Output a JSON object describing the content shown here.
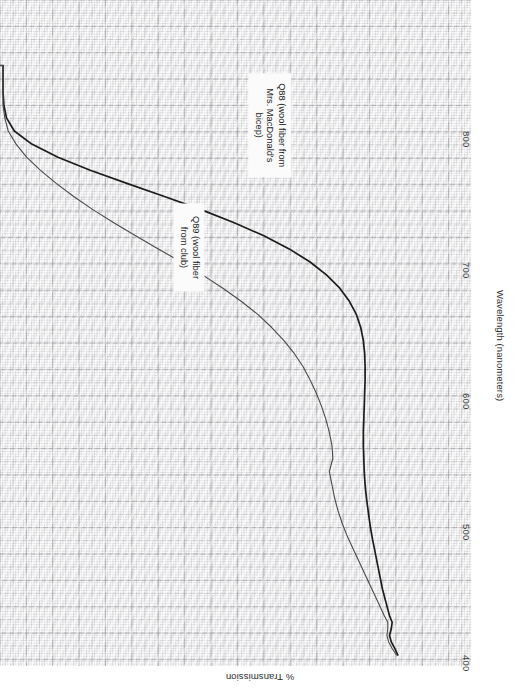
{
  "figure": {
    "background_color": "#ffffff",
    "grid_color": "#a8a8ae",
    "grid_major_color": "#808084"
  },
  "axes": {
    "x": {
      "title": "Wavelength (nanometers)",
      "ticks": [
        "400",
        "500",
        "600",
        "700",
        "800"
      ],
      "tick_values": [
        400,
        500,
        600,
        700,
        800
      ],
      "range": [
        395,
        850
      ]
    },
    "y": {
      "title": "% Transmission",
      "ticks": [],
      "range": [
        0,
        100
      ]
    }
  },
  "annotations": [
    {
      "id": "q88",
      "text": "Q88 (wool fiber from\nMrs. MacDonald's\nbicep)",
      "series": "Q88"
    },
    {
      "id": "q89",
      "text": "Q89 (wool fiber\nfrom club)",
      "series": "Q89"
    }
  ],
  "chart_data": {
    "type": "line",
    "title": "",
    "xlabel": "Wavelength (nanometers)",
    "ylabel": "% Transmission",
    "xlim": [
      395,
      850
    ],
    "ylim": [
      0,
      100
    ],
    "grid": true,
    "legend_position": "inline-annotations",
    "orientation": "rotated-90cw",
    "series": [
      {
        "name": "Q88",
        "label": "Q88 (wool fiber from Mrs. MacDonald's bicep)",
        "color": "#1c1c1c",
        "width": 1.7,
        "x": [
          400,
          405,
          410,
          415,
          420,
          425,
          430,
          440,
          450,
          460,
          470,
          480,
          490,
          500,
          510,
          520,
          530,
          540,
          550,
          560,
          570,
          580,
          590,
          600,
          610,
          620,
          630,
          640,
          650,
          660,
          670,
          680,
          690,
          700,
          710,
          720,
          730,
          740,
          750,
          760,
          770,
          780,
          790,
          800,
          810,
          820,
          830,
          840,
          850
        ],
        "y": [
          0.5,
          1.2,
          2.0,
          2.4,
          2.0,
          1.8,
          2.4,
          3.2,
          4.0,
          4.6,
          5.2,
          5.8,
          6.4,
          6.9,
          7.3,
          7.7,
          8.0,
          8.2,
          8.3,
          8.4,
          8.4,
          8.3,
          8.2,
          8.1,
          8.0,
          8.0,
          8.1,
          8.4,
          9.0,
          10.0,
          11.6,
          13.8,
          16.8,
          20.6,
          25.4,
          31.2,
          38.0,
          45.6,
          54.0,
          62.6,
          71.0,
          78.4,
          84.4,
          88.4,
          90.2,
          90.8,
          91.0,
          91.0,
          91.0
        ]
      },
      {
        "name": "Q89",
        "label": "Q89 (wool fiber from club)",
        "color": "#4a4a4a",
        "width": 1.1,
        "x": [
          400,
          405,
          410,
          415,
          420,
          425,
          430,
          440,
          450,
          460,
          470,
          480,
          490,
          500,
          510,
          520,
          530,
          540,
          550,
          560,
          570,
          580,
          590,
          600,
          610,
          620,
          630,
          640,
          650,
          660,
          670,
          680,
          690,
          700,
          710,
          720,
          730,
          740,
          750,
          760,
          770,
          780,
          790,
          800,
          810,
          820,
          830,
          840,
          850
        ],
        "y": [
          0.8,
          1.8,
          2.6,
          3.0,
          2.8,
          2.8,
          3.6,
          5.0,
          6.4,
          7.8,
          9.2,
          10.6,
          12.0,
          13.2,
          14.2,
          15.0,
          15.6,
          16.2,
          15.4,
          15.6,
          16.2,
          17.0,
          18.0,
          19.2,
          20.6,
          22.2,
          24.2,
          26.6,
          29.4,
          32.6,
          36.4,
          40.6,
          45.2,
          50.2,
          55.4,
          60.6,
          65.6,
          70.4,
          74.8,
          78.8,
          82.4,
          85.6,
          88.0,
          89.8,
          90.6,
          91.0,
          91.0,
          91.0,
          91.0
        ]
      }
    ]
  }
}
